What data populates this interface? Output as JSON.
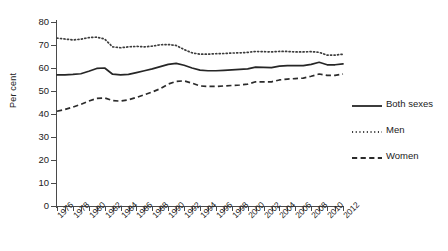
{
  "chart_data": {
    "type": "line",
    "title": "",
    "xlabel": "",
    "ylabel": "Per cent",
    "ylim": [
      0,
      80
    ],
    "ytick_step": 10,
    "yticks": [
      80,
      70,
      60,
      50,
      40,
      30,
      20,
      10,
      0
    ],
    "grid": false,
    "legend_position": "right",
    "x_tick_interval_years": 1,
    "x_label_interval_years": 2,
    "xlim": [
      1976,
      2012
    ],
    "x": [
      1976,
      1977,
      1978,
      1979,
      1980,
      1981,
      1982,
      1983,
      1984,
      1985,
      1986,
      1987,
      1988,
      1989,
      1990,
      1991,
      1992,
      1993,
      1994,
      1995,
      1996,
      1997,
      1998,
      1999,
      2000,
      2001,
      2002,
      2003,
      2004,
      2005,
      2006,
      2007,
      2008,
      2009,
      2010,
      2011,
      2012
    ],
    "tick_labels": [
      "1976",
      "1978",
      "1980",
      "1982",
      "1984",
      "1986",
      "1988",
      "1990",
      "1992",
      "1994",
      "1996",
      "1998",
      "2000",
      "2002",
      "2004",
      "2006",
      "2008",
      "2010",
      "2012"
    ],
    "series": [
      {
        "name": "Both sexes",
        "style": "solid",
        "values": [
          57.0,
          57.0,
          57.2,
          57.5,
          58.6,
          59.8,
          60.0,
          57.3,
          57.0,
          57.2,
          58.0,
          58.8,
          59.6,
          60.6,
          61.6,
          62.0,
          61.2,
          60.0,
          59.1,
          58.8,
          58.8,
          59.0,
          59.2,
          59.4,
          59.6,
          60.4,
          60.3,
          60.2,
          60.8,
          61.0,
          61.0,
          61.0,
          61.6,
          62.5,
          61.4,
          61.4,
          61.8
        ]
      },
      {
        "name": "Men",
        "style": "dotted",
        "values": [
          73.0,
          72.6,
          72.2,
          72.5,
          73.2,
          73.4,
          72.6,
          69.2,
          68.8,
          69.2,
          69.4,
          69.2,
          69.5,
          70.1,
          70.2,
          69.8,
          68.0,
          66.6,
          66.0,
          66.0,
          66.2,
          66.3,
          66.5,
          66.6,
          66.8,
          67.2,
          67.1,
          67.0,
          67.2,
          67.2,
          67.0,
          67.0,
          67.1,
          66.8,
          65.6,
          65.6,
          66.0
        ]
      },
      {
        "name": "Women",
        "style": "dashed",
        "values": [
          41.2,
          42.0,
          43.0,
          44.2,
          45.6,
          46.8,
          47.0,
          45.8,
          45.6,
          46.2,
          47.2,
          48.4,
          49.6,
          51.0,
          53.0,
          54.2,
          54.4,
          53.4,
          52.2,
          52.0,
          52.0,
          52.2,
          52.4,
          52.6,
          53.0,
          54.0,
          54.0,
          54.0,
          54.8,
          55.2,
          55.4,
          55.6,
          56.4,
          57.4,
          56.8,
          56.8,
          57.4
        ]
      }
    ]
  },
  "legend": {
    "items": [
      {
        "label": "Both sexes",
        "style": "solid"
      },
      {
        "label": "Men",
        "style": "dotted"
      },
      {
        "label": "Women",
        "style": "dashed"
      }
    ]
  }
}
